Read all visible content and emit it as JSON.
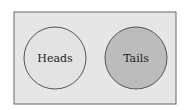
{
  "diagram": {
    "type": "venn",
    "universe": {
      "fill": "#e6e6e6",
      "stroke": "#666666"
    },
    "sets": [
      {
        "label": "Heads",
        "fill": "#e3e3e3",
        "stroke": "#555555"
      },
      {
        "label": "Tails",
        "fill": "#bcbcbc",
        "stroke": "#555555"
      }
    ]
  }
}
